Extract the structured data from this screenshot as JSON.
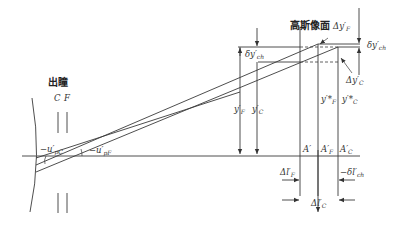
{
  "diagram": {
    "title_exit_pupil": "出瞳",
    "pupil_C": "C",
    "pupil_F": "F",
    "gauss_image_plane": "高斯像面",
    "labels": {
      "u_pc": "−u′",
      "u_pc_sub": "pC",
      "u_pf": "−u′",
      "u_pf_sub": "pF",
      "delta_y_ch": "δy′",
      "delta_y_ch_sub": "ch",
      "delta_y_ch_star": "δy′",
      "delta_y_ch_star_sub": "ch",
      "delta_y_f": "Δy′",
      "delta_y_f_sub": "F",
      "delta_y_c": "Δy′",
      "delta_y_c_sub": "C",
      "y_f": "y′",
      "y_f_sub": "F",
      "y_c": "y′",
      "y_c_sub": "C",
      "y_f_star": "y′*",
      "y_f_star_sub": "F",
      "y_c_star": "y′*",
      "y_c_star_sub": "C",
      "A_prime": "A′",
      "A_f": "A′",
      "A_f_sub": "F",
      "A_c": "A′",
      "A_c_sub": "C",
      "delta_l_f": "Δl′",
      "delta_l_f_sub": "F",
      "delta_l_c": "Δl′",
      "delta_l_c_sub": "C",
      "delta_l_ch": "−δl′",
      "delta_l_ch_sub": "ch"
    }
  }
}
